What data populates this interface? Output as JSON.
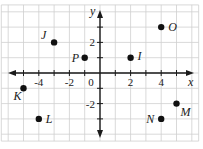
{
  "chart_data": {
    "type": "scatter",
    "title": "",
    "xlabel": "x",
    "ylabel": "y",
    "xlim": [
      -6,
      6
    ],
    "ylim": [
      -4,
      4
    ],
    "grid": true,
    "x_tick_labels": [
      {
        "value": -4,
        "label": "-4"
      },
      {
        "value": -2,
        "label": "-2"
      },
      {
        "value": 0,
        "label": "0"
      },
      {
        "value": 2,
        "label": "2"
      },
      {
        "value": 4,
        "label": "4"
      }
    ],
    "y_tick_labels": [
      {
        "value": 2,
        "label": "2"
      },
      {
        "value": -2,
        "label": "-2"
      }
    ],
    "points": [
      {
        "label": "J",
        "x": -3,
        "y": 2
      },
      {
        "label": "P",
        "x": -1,
        "y": 1
      },
      {
        "label": "O",
        "x": 4,
        "y": 3
      },
      {
        "label": "I",
        "x": 2,
        "y": 1
      },
      {
        "label": "K",
        "x": -5,
        "y": -1
      },
      {
        "label": "L",
        "x": -4,
        "y": -3
      },
      {
        "label": "M",
        "x": 5,
        "y": -2
      },
      {
        "label": "N",
        "x": 4,
        "y": -3
      }
    ]
  },
  "layout": {
    "origin_px": [
      100,
      73
    ],
    "unit_px": 15.3,
    "label_offsets": {
      "J": [
        -13,
        -3
      ],
      "P": [
        -13,
        4
      ],
      "O": [
        7,
        4
      ],
      "I": [
        7,
        2
      ],
      "K": [
        -10,
        12
      ],
      "L": [
        7,
        4
      ],
      "M": [
        4,
        12
      ],
      "N": [
        -15,
        4
      ]
    }
  }
}
